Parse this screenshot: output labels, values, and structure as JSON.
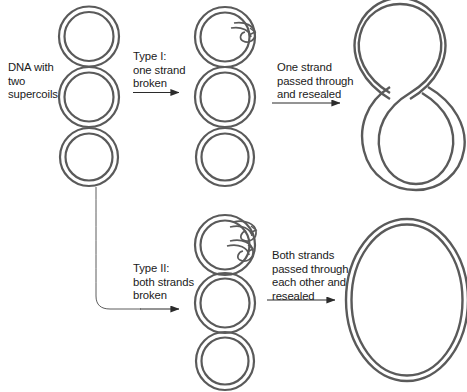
{
  "figure": {
    "topic": "DNA supercoil relaxation by topoisomerases",
    "stroke_color": "#5a5a5a",
    "text_color": "#1a1a1a",
    "arrow_color": "#3a3a3a",
    "background": "#ffffff"
  },
  "labels": {
    "dna_supercoils": "DNA with\ntwo\nsupercoils",
    "type_one": "Type I:\none strand\nbroken",
    "one_strand_passed": "One strand\npassed through\nand resealed",
    "type_two": "Type II:\nboth strands\nbroken",
    "both_strands_passed": "Both strands\npassed through\neach other and\nresealed"
  },
  "structures": {
    "supercoiled": {
      "name": "three-stacked-loops-supercoiled-dna",
      "loop_count": 3
    },
    "nicked_type1": {
      "name": "supercoiled-dna-single-strand-nick",
      "loop_count": 3,
      "break_marks": 1
    },
    "figure_eight": {
      "name": "figure-eight-one-supercoil",
      "loop_count": 2
    },
    "nicked_type2": {
      "name": "supercoiled-dna-double-strand-break",
      "loop_count": 3,
      "break_marks": 2
    },
    "relaxed_circle": {
      "name": "relaxed-circular-dna",
      "loop_count": 1
    }
  },
  "arrows": {
    "type_one_arrow": "arrow-right",
    "one_strand_arrow": "arrow-right",
    "type_two_arrow": "arrow-right",
    "both_strands_arrow": "arrow-right",
    "branch_connector": "curved-branch-line"
  }
}
